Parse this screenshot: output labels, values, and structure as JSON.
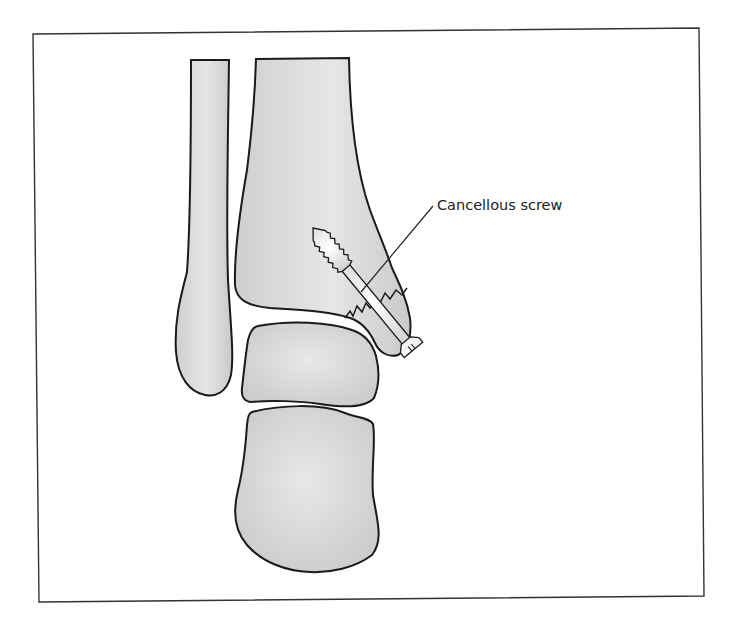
{
  "figure": {
    "labels": [
      {
        "id": "cancellous-screw",
        "text": "Cancellous screw"
      }
    ],
    "colors": {
      "background": "#ffffff",
      "frame": "#333333",
      "bone_fill": "#d4d4d4",
      "bone_highlight": "#ebebeb",
      "outline": "#1a1a1a",
      "screw_fill": "#f2f2f2",
      "leader_line": "#222222"
    }
  }
}
